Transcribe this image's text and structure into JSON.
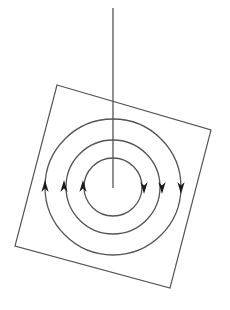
{
  "figure": {
    "background_color": "#ffffff",
    "line_color": "#555555",
    "arrow_color": "#1a1a1a",
    "canvas": {
      "width": 230,
      "height": 310
    }
  },
  "wire": {
    "label": "current-carrying-wire",
    "x": 113,
    "y_top": 8,
    "y_bottom": 188,
    "stroke_width": 1.3
  },
  "plane": {
    "label": "tilted-square-plane",
    "stroke_width": 1.2,
    "points": "57,85 211,130 170,288 15,246",
    "corners": [
      {
        "name": "top-left",
        "x": 57,
        "y": 85
      },
      {
        "name": "top-right",
        "x": 211,
        "y": 130
      },
      {
        "name": "bottom-right",
        "x": 170,
        "y": 288
      },
      {
        "name": "bottom-left",
        "x": 15,
        "y": 246
      }
    ]
  },
  "field_lines": {
    "center": {
      "x": 113,
      "y": 187
    },
    "stroke_width": 1.3,
    "circles": [
      {
        "name": "field-circle-inner",
        "radius": 29
      },
      {
        "name": "field-circle-middle",
        "radius": 47
      },
      {
        "name": "field-circle-outer",
        "radius": 68
      }
    ]
  },
  "arrows": {
    "size": 7,
    "left_direction": "up",
    "right_direction": "down",
    "left": [
      {
        "name": "arrow-left-outer",
        "x": 45,
        "y": 187
      },
      {
        "name": "arrow-left-middle",
        "x": 64,
        "y": 187
      },
      {
        "name": "arrow-left-inner",
        "x": 83,
        "y": 187
      }
    ],
    "right": [
      {
        "name": "arrow-right-inner",
        "x": 144,
        "y": 187
      },
      {
        "name": "arrow-right-middle",
        "x": 162,
        "y": 187
      },
      {
        "name": "arrow-right-outer",
        "x": 181,
        "y": 187
      }
    ]
  }
}
